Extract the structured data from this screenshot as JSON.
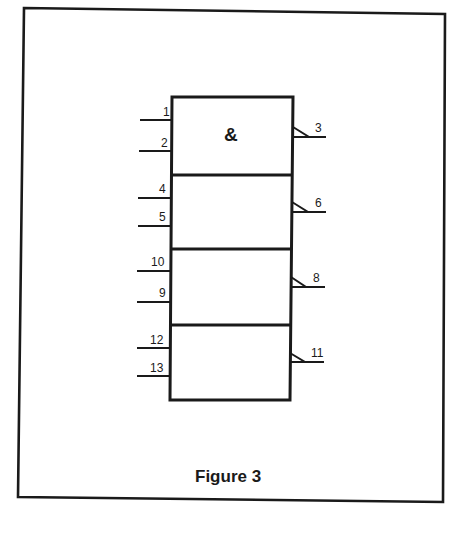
{
  "figure": {
    "caption": "Figure 3",
    "gate_symbol": "&",
    "gates": [
      {
        "inputs": [
          "1",
          "2"
        ],
        "output": "3"
      },
      {
        "inputs": [
          "4",
          "5"
        ],
        "output": "6"
      },
      {
        "inputs": [
          "10",
          "9"
        ],
        "output": "8"
      },
      {
        "inputs": [
          "12",
          "13"
        ],
        "output": "11"
      }
    ],
    "colors": {
      "ink": "#1a1a1a",
      "background": "#ffffff"
    }
  }
}
